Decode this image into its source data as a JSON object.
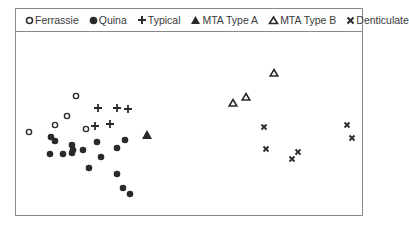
{
  "chart_data": {
    "type": "scatter",
    "title": "",
    "xlabel": "",
    "ylabel": "",
    "grid": false,
    "legend_position": "top",
    "axes_visible": false,
    "series": [
      {
        "name": "Ferrassie",
        "marker": "open-circle",
        "points": [
          [
            76,
            96
          ],
          [
            67,
            116
          ],
          [
            55,
            125
          ],
          [
            86,
            129
          ],
          [
            29,
            132
          ]
        ]
      },
      {
        "name": "Quina",
        "marker": "filled-circle",
        "points": [
          [
            51,
            137
          ],
          [
            55,
            141
          ],
          [
            50,
            154
          ],
          [
            63,
            154
          ],
          [
            72,
            145
          ],
          [
            73,
            150
          ],
          [
            72,
            153
          ],
          [
            83,
            150
          ],
          [
            97,
            142
          ],
          [
            101,
            157
          ],
          [
            89,
            168
          ],
          [
            117,
            148
          ],
          [
            125,
            140
          ],
          [
            117,
            174
          ],
          [
            123,
            188
          ],
          [
            130,
            194
          ]
        ]
      },
      {
        "name": "Typical",
        "marker": "plus",
        "points": [
          [
            98,
            108
          ],
          [
            117,
            108
          ],
          [
            128,
            109
          ],
          [
            95,
            126
          ],
          [
            110,
            124
          ]
        ]
      },
      {
        "name": "MTA Type A",
        "marker": "filled-triangle",
        "points": [
          [
            147,
            135
          ]
        ]
      },
      {
        "name": "MTA Type B",
        "marker": "open-triangle",
        "points": [
          [
            274,
            73
          ],
          [
            233,
            103
          ],
          [
            246,
            97
          ]
        ]
      },
      {
        "name": "Denticulate",
        "marker": "x",
        "points": [
          [
            264,
            127
          ],
          [
            266,
            149
          ],
          [
            292,
            159
          ],
          [
            298,
            152
          ],
          [
            347,
            125
          ],
          [
            352,
            138
          ]
        ]
      }
    ]
  },
  "legend": {
    "items": [
      {
        "label": "Ferrassie",
        "icon": "open-circle-icon"
      },
      {
        "label": "Quina",
        "icon": "filled-circle-icon"
      },
      {
        "label": "Typical",
        "icon": "plus-icon"
      },
      {
        "label": "MTA Type A",
        "icon": "filled-triangle-icon"
      },
      {
        "label": "MTA Type B",
        "icon": "open-triangle-icon"
      },
      {
        "label": "Denticulate",
        "icon": "x-icon"
      }
    ]
  },
  "colors": {
    "marker": "#2a2a2a",
    "border": "#8a8a8a",
    "text": "#3a3a3a"
  }
}
